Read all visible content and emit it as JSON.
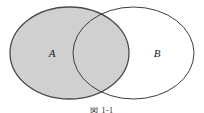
{
  "figure": {
    "type": "venn-diagram",
    "width": 204,
    "height": 113,
    "background_color": "#ffffff",
    "caption": "図 1-1",
    "caption_clipped": true
  },
  "sets": [
    {
      "id": "A",
      "label": "A",
      "shaded": true,
      "fill_color": "#d0d0d0",
      "stroke_color": "#4a4a4a",
      "stroke_width": 1.3,
      "cx": 69.5,
      "cy": 53,
      "rx": 59.5,
      "ry": 46,
      "label_x": 52,
      "label_y": 53
    },
    {
      "id": "B",
      "label": "B",
      "shaded": false,
      "fill_color": "none",
      "stroke_color": "#3c3c3c",
      "stroke_width": 1.0,
      "cx": 133.5,
      "cy": 53,
      "rx": 60.5,
      "ry": 46,
      "label_x": 157,
      "label_y": 53
    }
  ],
  "regions": {
    "intersection_shaded": true,
    "intersection_label": "A ∩ B",
    "shaded_description": "A"
  }
}
